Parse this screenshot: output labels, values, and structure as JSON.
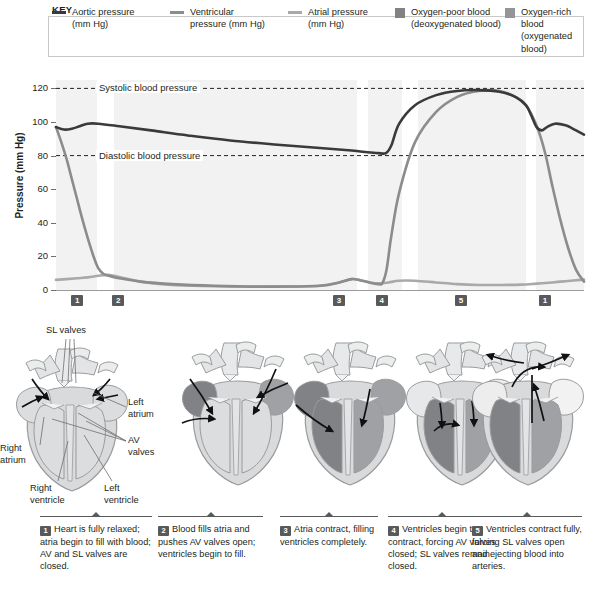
{
  "key": {
    "title": "KEY",
    "items": [
      {
        "marker": "line",
        "color": "#3a3a3c",
        "label": "Aortic pressure\n(mm Hg)",
        "name": "aortic-pressure"
      },
      {
        "marker": "line",
        "color": "#8a8c8e",
        "label": "Ventricular\npressure (mm Hg)",
        "name": "ventricular-pressure"
      },
      {
        "marker": "line",
        "color": "#a7a9ac",
        "label": "Atrial pressure\n(mm Hg)",
        "name": "atrial-pressure"
      },
      {
        "marker": "swatch",
        "color": "#808285",
        "label": "Oxygen-poor blood\n(deoxygenated blood)",
        "name": "oxygen-poor-blood"
      },
      {
        "marker": "swatch",
        "color": "#939598",
        "label": "Oxygen-rich blood\n(oxygenated blood)",
        "name": "oxygen-rich-blood"
      }
    ]
  },
  "chart_data": {
    "type": "line",
    "title": "",
    "xlabel": "",
    "ylabel": "Pressure (mm Hg)",
    "ylim": [
      0,
      125
    ],
    "yticks": [
      0,
      20,
      40,
      60,
      80,
      100,
      120
    ],
    "grid": false,
    "legend_position": "top",
    "annotations": [
      {
        "label": "Systolic blood pressure",
        "y": 120,
        "style": "dashed"
      },
      {
        "label": "Diastolic blood pressure",
        "y": 80,
        "style": "dashed"
      }
    ],
    "phase_markers": [
      {
        "label": "1",
        "x_pct": 4.0
      },
      {
        "label": "2",
        "x_pct": 11.8
      },
      {
        "label": "3",
        "x_pct": 53.6
      },
      {
        "label": "4",
        "x_pct": 61.7
      },
      {
        "label": "5",
        "x_pct": 76.7
      },
      {
        "label": "1",
        "x_pct": 92.6
      }
    ],
    "shaded_bands": [
      {
        "from_pct": 0.0,
        "to_pct": 7.8,
        "color": "#f2f2f2"
      },
      {
        "from_pct": 11.0,
        "to_pct": 57.0,
        "color": "#f2f2f2"
      },
      {
        "from_pct": 59.0,
        "to_pct": 65.5,
        "color": "#f2f2f2"
      },
      {
        "from_pct": 68.5,
        "to_pct": 89.0,
        "color": "#f2f2f2"
      },
      {
        "from_pct": 91.0,
        "to_pct": 100.0,
        "color": "#f2f2f2"
      }
    ],
    "series": [
      {
        "name": "Aortic pressure (mm Hg)",
        "color": "#3a3a3c",
        "width": 2.6,
        "x": [
          0,
          1.5,
          3.0,
          4.5,
          6.0,
          8,
          12,
          18,
          25,
          33,
          42,
          50,
          56,
          59,
          61,
          62.5,
          63.5,
          65,
          68,
          72,
          76,
          80,
          84,
          87,
          89,
          90,
          91,
          92,
          93,
          94.5,
          96.5,
          98.5,
          100
        ],
        "y": [
          97,
          95.5,
          96,
          97.5,
          99,
          99,
          97.5,
          95,
          92,
          89,
          86.5,
          84.5,
          83,
          82,
          81.5,
          81.5,
          86,
          99,
          110,
          116,
          118.5,
          119,
          118,
          115,
          110,
          104,
          97,
          95,
          97,
          99,
          98,
          95,
          92.5
        ]
      },
      {
        "name": "Ventricular pressure (mm Hg)",
        "color": "#8a8c8e",
        "width": 2.6,
        "x": [
          0,
          1,
          2,
          3,
          4,
          5,
          6,
          7,
          8,
          9,
          10,
          12,
          16,
          22,
          30,
          40,
          50,
          53.6,
          56,
          58,
          60,
          61,
          61.8,
          62.6,
          63.5,
          65,
          68,
          72,
          76,
          80,
          84,
          87,
          89,
          91,
          92.6,
          94,
          95.5,
          97,
          98.5,
          100
        ],
        "y": [
          97,
          88,
          78,
          66,
          54,
          42,
          31,
          21,
          13,
          9.5,
          8.5,
          7,
          5,
          3.5,
          2.5,
          2,
          2.5,
          4.5,
          6.5,
          5.5,
          4,
          3.5,
          4,
          12,
          32,
          58,
          88,
          106,
          115,
          118.5,
          118.5,
          115,
          110,
          98,
          82,
          62,
          42,
          25,
          12,
          5
        ]
      },
      {
        "name": "Atrial pressure (mm Hg)",
        "color": "#a7a9ac",
        "width": 2.6,
        "x": [
          0,
          2,
          4,
          6,
          8,
          9.5,
          11,
          13,
          16,
          20,
          26,
          34,
          42,
          50,
          53.6,
          56,
          58,
          60,
          61.7,
          63,
          65,
          68,
          72,
          76,
          80,
          84,
          88,
          91,
          94,
          96.5,
          98.5,
          100
        ],
        "y": [
          6,
          6.5,
          7,
          7.5,
          8.5,
          9,
          8.5,
          7,
          5,
          3.5,
          2.5,
          2,
          2,
          2.5,
          4.5,
          6.5,
          5.5,
          4.2,
          4,
          4.5,
          5.5,
          5.5,
          4.5,
          3.5,
          3,
          3,
          3.2,
          3.8,
          4.5,
          5.2,
          5.8,
          6.2
        ]
      }
    ]
  },
  "heart_annotations": [
    {
      "name": "sl-valves",
      "text": "SL valves"
    },
    {
      "name": "left-atrium",
      "text": "Left\natrium"
    },
    {
      "name": "av-valves",
      "text": "AV\nvalves"
    },
    {
      "name": "right-atrium",
      "text": "Right\natrium"
    },
    {
      "name": "right-ventricle",
      "text": "Right\nventricle"
    },
    {
      "name": "left-ventricle",
      "text": "Left\nventricle"
    }
  ],
  "captions": [
    {
      "number": "1",
      "text": "Heart is fully relaxed; atria begin to fill with blood; AV and SL valves are closed."
    },
    {
      "number": "2",
      "text": "Blood fills atria and pushes AV valves open; ventricles begin to fill."
    },
    {
      "number": "3",
      "text": "Atria contract, filling ventricles completely."
    },
    {
      "number": "4",
      "text": "Ventricles begin to contract, forcing AV valves closed; SL valves remain closed."
    },
    {
      "number": "5",
      "text": "Ventricles contract fully, forcing SL valves open and ejecting blood into arteries."
    }
  ],
  "colors": {
    "oxygen_poor": "#808285",
    "oxygen_rich": "#bcbec0",
    "heart_muscle": "#d9dadb",
    "outline": "#9a9b9d",
    "band": "#f2f2f2"
  }
}
